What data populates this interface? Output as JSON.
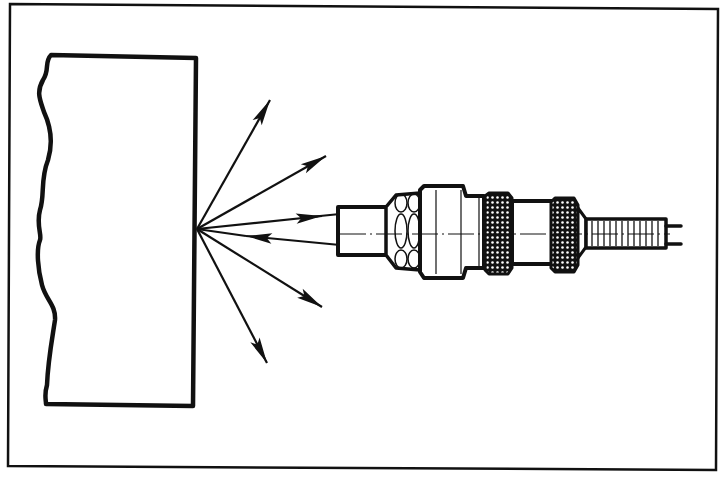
{
  "diagram": {
    "type": "technical-illustration",
    "colors": {
      "ink": "#111111",
      "background": "#ffffff"
    },
    "elements": {
      "frame": "outer-border",
      "target": "target-object-with-broken-edge",
      "emitted_rays": 5,
      "sensor_rays": {
        "outgoing": 1,
        "returning": 1
      },
      "sensor_parts": [
        "lens-tip",
        "threaded-section",
        "body",
        "knurled-nut-1",
        "knurled-nut-2",
        "cable-strain-relief",
        "lead-wires"
      ]
    },
    "labels": []
  }
}
